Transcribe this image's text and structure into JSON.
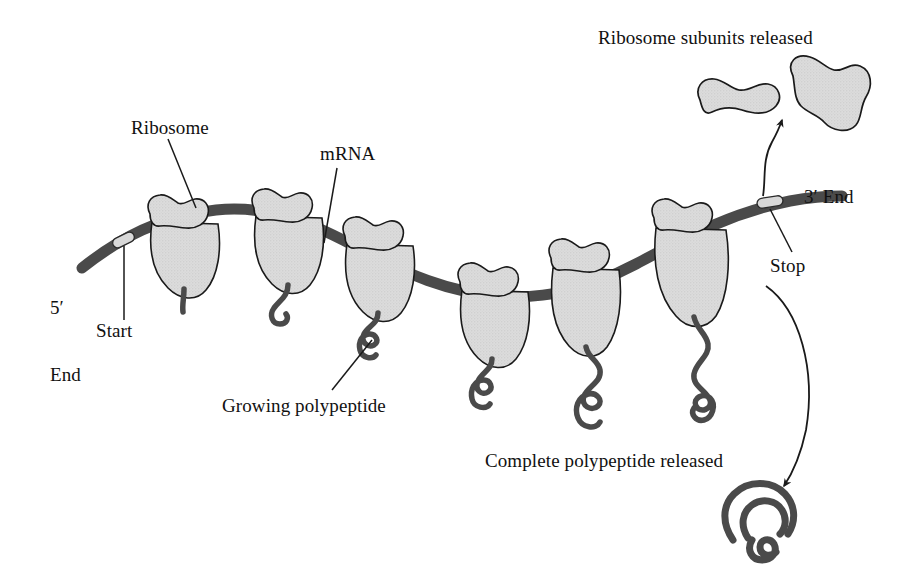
{
  "figure": {
    "background_color": "#ffffff",
    "width": 911,
    "height": 572
  },
  "colors": {
    "subunit_fill": "#d6d6d6",
    "subunit_stroke": "#1a1a1a",
    "mrna_strand": "#4a4a4a",
    "codon_marker_fill": "#d8d8d8",
    "polypeptide": "#4a4a4a",
    "text": "#111111",
    "leader_line": "#1a1a1a"
  },
  "labels": {
    "ribosome": "Ribosome",
    "mrna": "mRNA",
    "subunits_released": "Ribosome subunits released",
    "three_prime_end": "3′ End",
    "stop": "Stop",
    "five_prime_end_line1": "5′",
    "five_prime_end_line2": "End",
    "start": "Start",
    "growing_polypeptide": "Growing polypeptide",
    "complete_polypeptide": "Complete polypeptide released"
  },
  "mrna": {
    "start_codon_marker": "Start",
    "stop_codon_marker": "Stop",
    "five_prime_terminus": "5′ End",
    "three_prime_terminus": "3′ End",
    "direction": "5′ to 3′, left to right"
  },
  "ribosomes": [
    {
      "index": 1,
      "polypeptide_length": "shortest"
    },
    {
      "index": 2,
      "polypeptide_length": "short"
    },
    {
      "index": 3,
      "polypeptide_length": "medium"
    },
    {
      "index": 4,
      "polypeptide_length": "medium-long"
    },
    {
      "index": 5,
      "polypeptide_length": "long"
    },
    {
      "index": 6,
      "polypeptide_length": "longest"
    }
  ],
  "released": {
    "small_subunit": "small ribosomal subunit",
    "large_subunit": "large ribosomal subunit",
    "folded_polypeptide": "complete folded polypeptide"
  }
}
